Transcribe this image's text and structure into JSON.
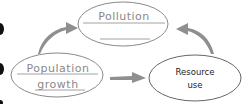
{
  "nodes": {
    "pollution": {
      "label": "Pollution"
    },
    "population_growth": {
      "line1": "Population",
      "line2": "growth"
    },
    "resource_use": {
      "line1": "Resource",
      "line2": "use"
    }
  },
  "arrows": [
    {
      "from": "population_growth",
      "to": "pollution"
    },
    {
      "from": "population_growth",
      "to": "resource_use"
    },
    {
      "from": "resource_use",
      "to": "pollution"
    }
  ],
  "colors": {
    "outline": "#8a8a8a",
    "arrow": "#8f8f8f",
    "left_bullets": "#111111"
  }
}
